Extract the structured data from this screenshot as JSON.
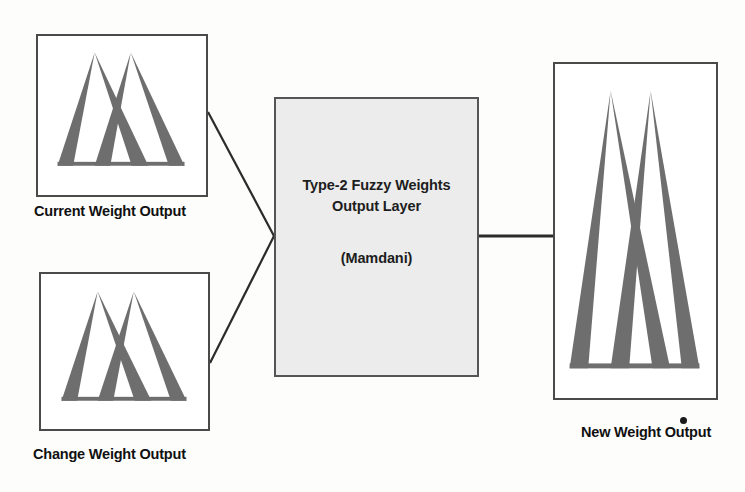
{
  "diagram": {
    "colors": {
      "membership_fill": "#6e6e6e",
      "box_border": "#4a4a4a",
      "process_fill": "#ececec",
      "connector": "#2b2b2b",
      "background": "#fdfdfc",
      "text": "#101010"
    }
  },
  "inputs": [
    {
      "id": "current-weight-output",
      "caption": "Current Weight Output",
      "graphic": "two-overlapping-triangular-membership-functions"
    },
    {
      "id": "change-weight-output",
      "caption": "Change Weight Output",
      "graphic": "two-overlapping-triangular-membership-functions"
    }
  ],
  "process": {
    "id": "type2-fuzzy-weights-output-layer",
    "title_line_1": "Type-2 Fuzzy Weights",
    "title_line_2": "Output Layer",
    "subtitle": "(Mamdani)"
  },
  "output": {
    "id": "new-weight-output",
    "caption": "New Weight Output",
    "graphic": "two-overlapping-tall-triangular-membership-functions"
  },
  "connectors": [
    {
      "id": "current-to-process",
      "from": "current-weight-output",
      "to": "type2-fuzzy-weights-output-layer",
      "style": "diagonal"
    },
    {
      "id": "change-to-process",
      "from": "change-weight-output",
      "to": "type2-fuzzy-weights-output-layer",
      "style": "diagonal"
    },
    {
      "id": "process-to-output",
      "from": "type2-fuzzy-weights-output-layer",
      "to": "new-weight-output",
      "style": "horizontal"
    }
  ]
}
